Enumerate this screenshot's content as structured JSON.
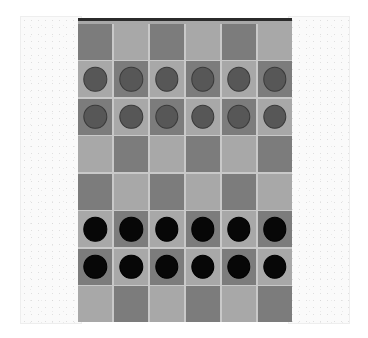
{
  "app": {
    "title": "Checkers Board",
    "canvas_background": "#ffffff"
  },
  "colors": {
    "light_square": "#a8a8a8",
    "dark_square": "#7c7c7c",
    "grid_line": "#c9c9c9",
    "board_border": "#2b2b2b",
    "panel_background": "#fafafa",
    "panel_border": "#eeeeee",
    "piece_gray_fill": "#575757",
    "piece_gray_outline": "#3a3a3a",
    "piece_black_fill": "#070707",
    "piece_black_outline": "#000000"
  },
  "panels": {
    "left": {
      "name": "left side panel",
      "label": ""
    },
    "right": {
      "name": "right side panel",
      "label": ""
    }
  },
  "board": {
    "columns": 6,
    "rows": 8,
    "top_left_square": "dark",
    "squares": [
      [
        "dark",
        "light",
        "dark",
        "light",
        "dark",
        "light"
      ],
      [
        "light",
        "dark",
        "light",
        "dark",
        "light",
        "dark"
      ],
      [
        "dark",
        "light",
        "dark",
        "light",
        "dark",
        "light"
      ],
      [
        "light",
        "dark",
        "light",
        "dark",
        "light",
        "dark"
      ],
      [
        "dark",
        "light",
        "dark",
        "light",
        "dark",
        "light"
      ],
      [
        "light",
        "dark",
        "light",
        "dark",
        "light",
        "dark"
      ],
      [
        "dark",
        "light",
        "dark",
        "light",
        "dark",
        "light"
      ],
      [
        "light",
        "dark",
        "light",
        "dark",
        "light",
        "dark"
      ]
    ],
    "pieces": [
      [
        null,
        null,
        null,
        null,
        null,
        null
      ],
      [
        "gray",
        "gray",
        "gray",
        "gray",
        "gray",
        "gray"
      ],
      [
        "gray",
        "gray",
        "gray",
        "gray",
        "gray",
        "gray"
      ],
      [
        null,
        null,
        null,
        null,
        null,
        null
      ],
      [
        null,
        null,
        null,
        null,
        null,
        null
      ],
      [
        "black",
        "black",
        "black",
        "black",
        "black",
        "black"
      ],
      [
        "black",
        "black",
        "black",
        "black",
        "black",
        "black"
      ],
      [
        null,
        null,
        null,
        null,
        null,
        null
      ]
    ],
    "piece_counts": {
      "gray": 12,
      "black": 12
    }
  }
}
